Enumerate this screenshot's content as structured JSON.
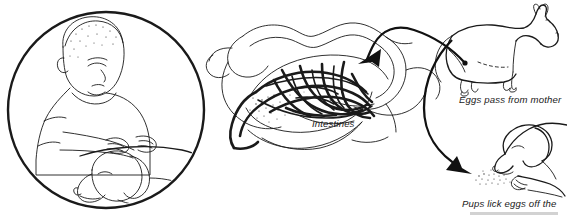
{
  "figure": {
    "background_color": "#ffffff",
    "ink_color": "#1a1a1a",
    "style": "black-and-white line drawing"
  },
  "panels": {
    "circle_inset": {
      "name": "child-petting-dog",
      "description": "Circular vignette of a child petting a dog lying down",
      "border_color": "#111111"
    },
    "intestines": {
      "name": "intestines-with-worms",
      "label": "Intestines",
      "description": "Cutaway of intestinal loops filled with tangled roundworms"
    },
    "adult_dog": {
      "name": "adult-dog",
      "description": "Adult dog standing in profile facing right"
    },
    "puppy": {
      "name": "puppy-licking-eggs",
      "description": "Puppy with head lowered licking eggs off the ground"
    }
  },
  "captions": [
    {
      "id": "intestines-label",
      "text": "Intestines",
      "x": 312,
      "y": 127
    },
    {
      "id": "eggs-pass-label",
      "text": "Eggs pass from mother",
      "x": 459,
      "y": 103
    },
    {
      "id": "pups-lick-label",
      "text": "Pups lick eggs off the",
      "x": 462,
      "y": 207
    }
  ],
  "arrows": [
    {
      "id": "arrow-mother-to-intestines",
      "from": "adult-dog",
      "to": "intestines-with-worms",
      "direction": "left",
      "color": "#111111"
    },
    {
      "id": "arrow-eggs-to-puppy",
      "from": "adult-dog",
      "to": "puppy-licking-eggs",
      "direction": "down-right",
      "color": "#111111"
    }
  ]
}
